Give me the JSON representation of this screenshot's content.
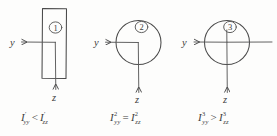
{
  "diagram": {
    "background_color": "#fdfdfc",
    "ink_color": "#4a4a4a",
    "figures": [
      {
        "id": "figure-1",
        "shape": "rectangle",
        "badge": "1",
        "axis_y_label": "y",
        "axis_z_label": "z",
        "formula": {
          "left_symbol": "I",
          "left_sup": "′",
          "left_sub": "yy",
          "operator": "<",
          "right_symbol": "I",
          "right_sup": "′",
          "right_sub": "zz",
          "plain": "I'yy < I'zz"
        }
      },
      {
        "id": "figure-2",
        "shape": "circle",
        "badge": "2",
        "axis_y_label": "y",
        "axis_z_label": "z",
        "formula": {
          "left_symbol": "I",
          "left_sup": "2",
          "left_sub": "yy",
          "operator": "=",
          "right_symbol": "I",
          "right_sup": "2",
          "right_sub": "zz",
          "plain": "I2yy = I2zz"
        }
      },
      {
        "id": "figure-3",
        "shape": "circle-with-extension",
        "badge": "3",
        "axis_y_label": "y",
        "axis_z_label": "z",
        "formula": {
          "left_symbol": "I",
          "left_sup": "3",
          "left_sub": "yy",
          "operator": ">",
          "right_symbol": "I",
          "right_sup": "3",
          "right_sub": "zz",
          "plain": "I3yy > I3zz"
        }
      }
    ]
  }
}
